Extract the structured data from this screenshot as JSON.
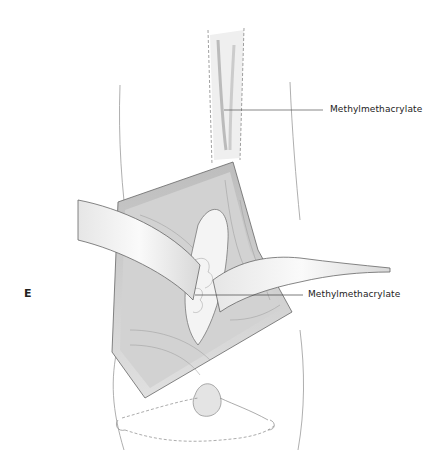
{
  "figure": {
    "panel_letter": "E",
    "labels": [
      {
        "text": "Methylmethacrylate",
        "target": "upper cement column"
      },
      {
        "text": "Methylmethacrylate",
        "target": "cement mass in wound"
      }
    ]
  }
}
